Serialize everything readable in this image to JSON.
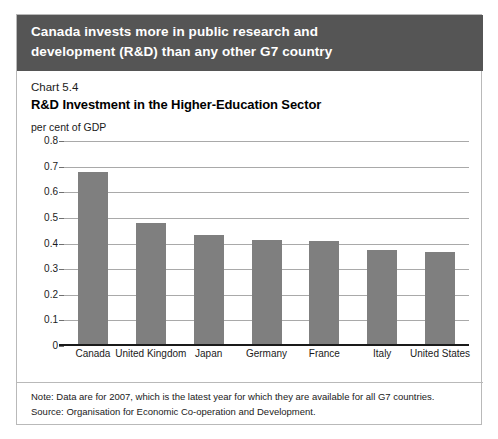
{
  "banner": {
    "line1": "Canada invests more in public research and",
    "line2": "development (R&D) than any other G7 country",
    "background": "#555555",
    "text_color": "#ffffff"
  },
  "chart_header": {
    "number": "Chart 5.4",
    "title": "R&D Investment in the Higher-Education Sector",
    "unit": "per cent of GDP"
  },
  "notes": {
    "note": "Note: Data are for 2007, which is the latest year for which they are available for all G7 countries.",
    "source": "Source: Organisation for Economic Co-operation and Development."
  },
  "chart_data": {
    "type": "bar",
    "title": "R&D Investment in the Higher-Education Sector",
    "subtitle": "Chart 5.4",
    "xlabel": "",
    "ylabel": "per cent of GDP",
    "ylim": [
      0,
      0.8
    ],
    "ytick_labels": [
      "0.8",
      "0.7",
      "0.6",
      "0.5",
      "0.4",
      "0.3",
      "0.2",
      "0.1",
      "0"
    ],
    "ytick_values": [
      0.8,
      0.7,
      0.6,
      0.5,
      0.4,
      0.3,
      0.2,
      0.1,
      0
    ],
    "grid": true,
    "legend": "none",
    "bar_color": "#7f7f7f",
    "categories": [
      "Canada",
      "United Kingdom",
      "Japan",
      "Germany",
      "France",
      "Italy",
      "United States"
    ],
    "values": [
      0.68,
      0.48,
      0.435,
      0.415,
      0.41,
      0.375,
      0.365
    ]
  }
}
